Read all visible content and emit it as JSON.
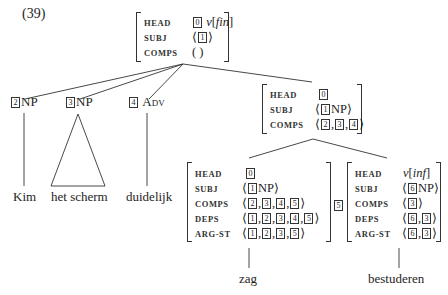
{
  "example_number": "(39)",
  "tree": {
    "root": {
      "head_tag": "0",
      "head_value": "v[fin]",
      "head_value_parts": {
        "v": "v",
        "open": "[",
        "fin": "fin",
        "close": "]"
      },
      "subj_tag": "1",
      "comps_value": "( )",
      "attrs": {
        "head": "HEAD",
        "subj": "SUBJ",
        "comps": "COMPS"
      }
    },
    "daughters": [
      {
        "tag": "2",
        "category": "NP",
        "word": "Kim",
        "terminal": "line"
      },
      {
        "tag": "3",
        "category": "NP",
        "word": "het scherm",
        "terminal": "triangle"
      },
      {
        "tag": "4",
        "category": "Adv",
        "word": "duidelijk",
        "terminal": "line"
      }
    ],
    "head_daughter": {
      "head_tag": "0",
      "subj_tag": "1",
      "subj_cat": "NP",
      "comps_tags": [
        "2",
        "3",
        "4"
      ],
      "attrs": {
        "head": "HEAD",
        "subj": "SUBJ",
        "comps": "COMPS"
      }
    },
    "zag": {
      "word": "zag",
      "head_tag": "0",
      "subj_tag": "1",
      "subj_cat": "NP",
      "comps_tags": [
        "2",
        "3",
        "4",
        "5"
      ],
      "deps_tags": [
        "1",
        "2",
        "3",
        "4",
        "5"
      ],
      "argst_tags": [
        "1",
        "2",
        "3",
        "5"
      ],
      "attrs": {
        "head": "HEAD",
        "subj": "SUBJ",
        "comps": "COMPS",
        "deps": "DEPS",
        "argst": "ARG-ST"
      }
    },
    "bestuderen": {
      "word": "bestuderen",
      "outer_tag": "5",
      "head_value": "v[inf]",
      "head_value_parts": {
        "v": "v",
        "open": "[",
        "inf": "inf",
        "close": "]"
      },
      "subj_tag": "6",
      "subj_cat": "NP",
      "comps_tags": [
        "3"
      ],
      "deps_tags": [
        "6",
        "3"
      ],
      "argst_tags": [
        "6",
        "3"
      ],
      "attrs": {
        "head": "HEAD",
        "subj": "SUBJ",
        "comps": "COMPS",
        "deps": "DEPS",
        "argst": "ARG-ST"
      }
    }
  },
  "punct": {
    "lang": "⟨",
    "rang": "⟩",
    "comma": ", "
  }
}
